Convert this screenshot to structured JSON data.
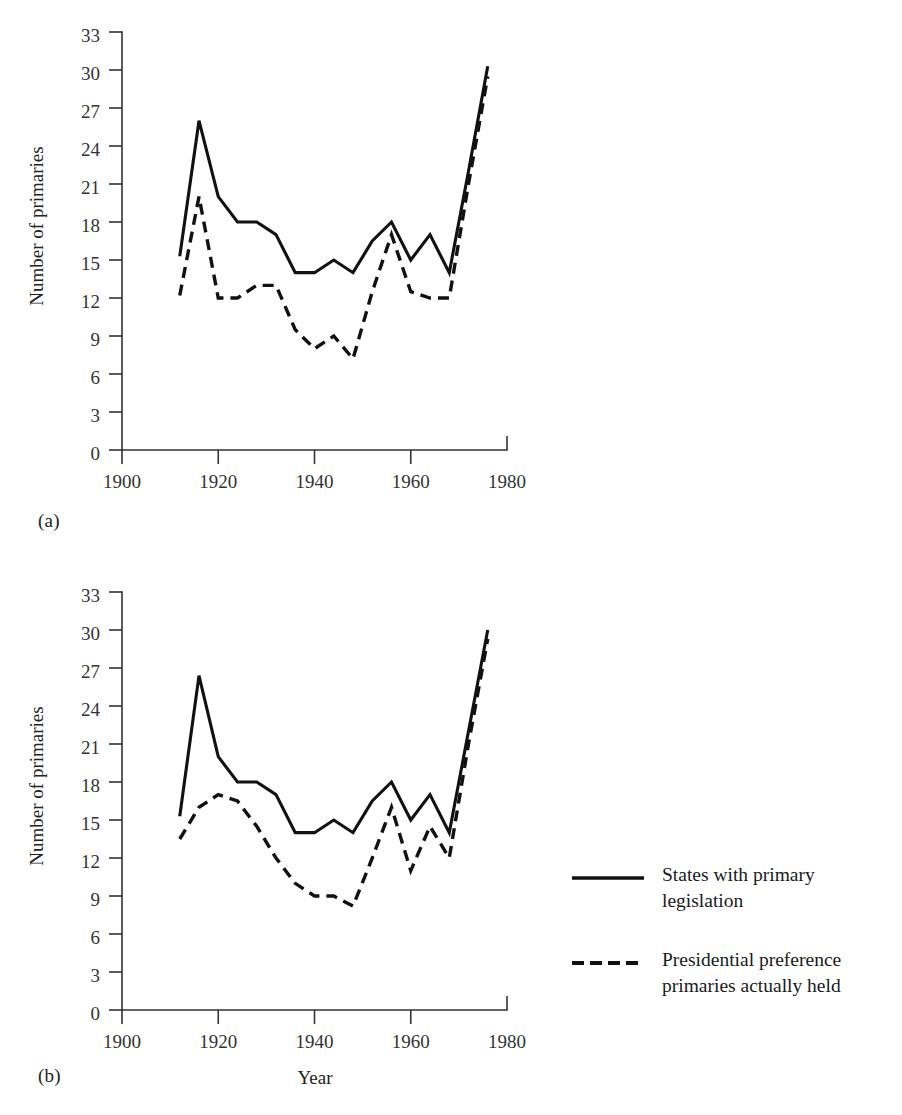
{
  "figure": {
    "background_color": "#ffffff",
    "line_color": "#111111",
    "axis_color": "#333333"
  },
  "panels": [
    {
      "id": "a",
      "label": "(a)",
      "ylabel": "Number of primaries",
      "xlabel": ""
    },
    {
      "id": "b",
      "label": "(b)",
      "ylabel": "Number of primaries",
      "xlabel": "Year"
    }
  ],
  "legend": {
    "position": "right",
    "entries": [
      {
        "style": "solid",
        "label": "States with primary\nlegislation",
        "line1": "States with primary",
        "line2": "legislation"
      },
      {
        "style": "dashed",
        "label": "Presidential preference\nprimaries actually held",
        "line1": "Presidential preference",
        "line2": "primaries actually held"
      }
    ]
  },
  "axes": {
    "y_ticks": [
      0,
      3,
      6,
      9,
      12,
      15,
      18,
      21,
      24,
      27,
      30,
      33
    ],
    "x_ticks": [
      1900,
      1920,
      1940,
      1960,
      1980
    ],
    "xlim": [
      1900,
      1980
    ],
    "ylim": [
      0,
      33
    ],
    "grid": false
  },
  "chart_data": [
    {
      "type": "line",
      "panel": "a",
      "title": "",
      "xlabel": "",
      "ylabel": "Number of primaries",
      "xlim": [
        1900,
        1980
      ],
      "ylim": [
        0,
        33
      ],
      "grid": false,
      "legend_position": "right",
      "x": [
        1912,
        1916,
        1920,
        1924,
        1928,
        1932,
        1936,
        1940,
        1944,
        1948,
        1952,
        1956,
        1960,
        1964,
        1968,
        1972,
        1976
      ],
      "series": [
        {
          "name": "States with primary legislation",
          "style": "solid",
          "values": [
            15.3,
            26,
            20,
            18,
            18,
            17,
            14,
            14,
            15,
            14,
            16.5,
            18,
            15,
            17,
            14,
            22,
            30.3
          ]
        },
        {
          "name": "Presidential preference primaries actually held",
          "style": "dashed",
          "values": [
            12.2,
            20,
            12,
            12,
            13,
            13,
            9.5,
            8,
            9,
            7.2,
            12.5,
            17,
            12.5,
            12,
            12,
            21,
            29.5
          ]
        }
      ]
    },
    {
      "type": "line",
      "panel": "b",
      "title": "",
      "xlabel": "Year",
      "ylabel": "Number of primaries",
      "xlim": [
        1900,
        1980
      ],
      "ylim": [
        0,
        33
      ],
      "grid": false,
      "legend_position": "right",
      "x": [
        1912,
        1916,
        1920,
        1924,
        1928,
        1932,
        1936,
        1940,
        1944,
        1948,
        1952,
        1956,
        1960,
        1964,
        1968,
        1972,
        1976
      ],
      "series": [
        {
          "name": "States with primary legislation",
          "style": "solid",
          "values": [
            15.3,
            26.4,
            20,
            18,
            18,
            17,
            14,
            14,
            15,
            14,
            16.5,
            18,
            15,
            17,
            14,
            22,
            30
          ]
        },
        {
          "name": "Presidential preference primaries actually held",
          "style": "dashed",
          "values": [
            13.5,
            16,
            17,
            16.5,
            14.5,
            12,
            10,
            9,
            9,
            8.2,
            12,
            16,
            11,
            14.5,
            12,
            21,
            29.3
          ]
        }
      ]
    }
  ]
}
